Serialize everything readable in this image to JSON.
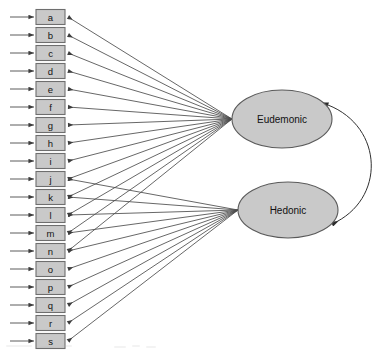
{
  "diagram": {
    "type": "sem-path-diagram",
    "width": 376,
    "height": 352,
    "background_color": "#ffffff",
    "box_fill_color": "#c9c9c9",
    "box_stroke_color": "#6e6e6e",
    "ellipse_fill_color": "#c9c9c9",
    "ellipse_stroke_color": "#5a5a5a",
    "path_color": "#4b4b4b",
    "covariance_color": "#303030"
  },
  "indicators": [
    {
      "id": "a",
      "label": "a",
      "y": 17,
      "factor": "Eudemonic"
    },
    {
      "id": "b",
      "label": "b",
      "y": 35,
      "factor": "Eudemonic"
    },
    {
      "id": "c",
      "label": "c",
      "y": 53,
      "factor": "Eudemonic"
    },
    {
      "id": "d",
      "label": "d",
      "y": 71,
      "factor": "Eudemonic"
    },
    {
      "id": "e",
      "label": "e",
      "y": 89,
      "factor": "Eudemonic"
    },
    {
      "id": "f",
      "label": "f",
      "y": 107,
      "factor": "Eudemonic"
    },
    {
      "id": "g",
      "label": "g",
      "y": 125,
      "factor": "Eudemonic"
    },
    {
      "id": "h",
      "label": "h",
      "y": 143,
      "factor": "Eudemonic"
    },
    {
      "id": "i",
      "label": "i",
      "y": 161,
      "factor": "Eudemonic"
    },
    {
      "id": "j",
      "label": "j",
      "y": 179,
      "factor": "Eudemonic"
    },
    {
      "id": "k",
      "label": "k",
      "y": 197,
      "factor": "Eudemonic"
    },
    {
      "id": "l",
      "label": "l",
      "y": 215,
      "factor": "Eudemonic"
    },
    {
      "id": "m",
      "label": "m",
      "y": 233,
      "factor": "Eudemonic"
    },
    {
      "id": "n",
      "label": "n",
      "y": 251,
      "factor": "Eudemonic"
    },
    {
      "id": "o",
      "label": "o",
      "y": 269,
      "factor": "Hedonic"
    },
    {
      "id": "p",
      "label": "p",
      "y": 287,
      "factor": "Hedonic"
    },
    {
      "id": "q",
      "label": "q",
      "y": 305,
      "factor": "Hedonic"
    },
    {
      "id": "r",
      "label": "r",
      "y": 323,
      "factor": "Hedonic"
    },
    {
      "id": "s",
      "label": "s",
      "y": 341,
      "factor": "Hedonic"
    }
  ],
  "hedonic_indicators": [
    "j",
    "k",
    "l",
    "m",
    "n",
    "o",
    "p",
    "q",
    "r",
    "s"
  ],
  "eudemonic_indicators": [
    "a",
    "b",
    "c",
    "d",
    "e",
    "f",
    "g",
    "h",
    "i",
    "j",
    "k",
    "l",
    "m",
    "n"
  ],
  "factors": [
    {
      "id": "eudemonic",
      "label": "Eudemonic",
      "cx": 282,
      "cy": 119,
      "rx": 50,
      "ry": 29
    },
    {
      "id": "hedonic",
      "label": "Hedonic",
      "cx": 288,
      "cy": 210,
      "rx": 50,
      "ry": 28
    }
  ],
  "covariance": {
    "label": "",
    "from": "eudemonic",
    "to": "hedonic",
    "double_headed": true
  },
  "residual_arrows": {
    "count": 19,
    "x_start": 10,
    "x_end": 34,
    "description": "error-term arrows entering each indicator from the left"
  },
  "geometry": {
    "box_x": 36,
    "box_width": 29,
    "box_height": 15
  }
}
